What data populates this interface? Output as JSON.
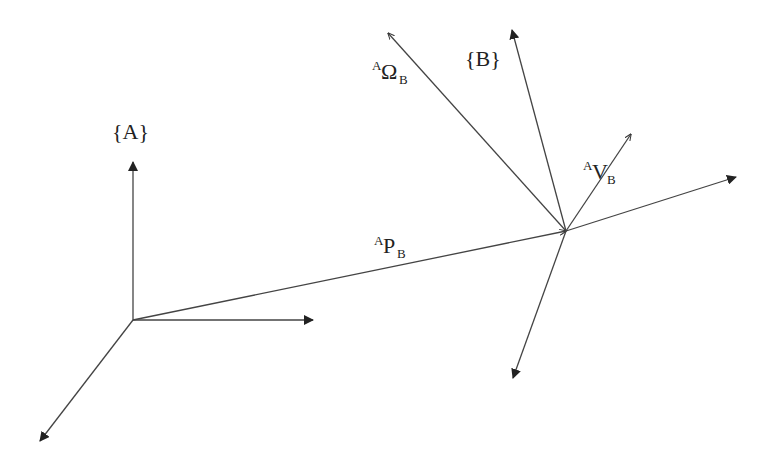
{
  "diagram": {
    "frame_a": {
      "label": "{A}"
    },
    "frame_b": {
      "label": "{B}"
    },
    "omega": {
      "sup": "A",
      "main": "Ω",
      "sub": "B"
    },
    "velocity": {
      "sup": "A",
      "main": "V",
      "sub": "B"
    },
    "position": {
      "sup": "A",
      "main": "P",
      "sub": "B"
    },
    "colors": {
      "line": "#444444",
      "text": "#222222",
      "background": "#ffffff"
    }
  }
}
